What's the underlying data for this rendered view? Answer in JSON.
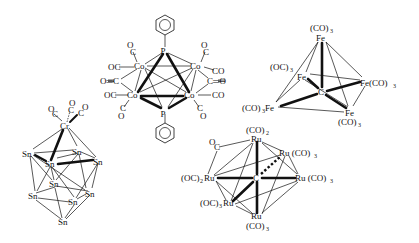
{
  "figure": {
    "background": "#ffffff",
    "ink": "#111111"
  },
  "clusters": {
    "co4p2": {
      "name": "Co4(CO)10(PPh)2",
      "atoms": {
        "p_top": "P",
        "p_bottom": "P",
        "co_tl": "Co",
        "co_tr": "Co",
        "co_bl": "Co",
        "co_br": "Co"
      },
      "ligands": {
        "tl_up": "O",
        "tl_up_c": "C",
        "tl_left": "OC",
        "bridge_left": "O═C",
        "bl_left": "OC",
        "bl_down_c": "C",
        "bl_down_o": "O",
        "tr_up": "O",
        "tr_up_c": "C",
        "tr_right": "CO",
        "bridge_right": "C═O",
        "br_right": "CO",
        "br_down_c": "C",
        "br_down_o": "O"
      }
    },
    "fe5c": {
      "name": "Fe5(CO)15C",
      "labels": {
        "top_co": "(CO)",
        "top_co_sub": "3",
        "top_fe": "Fe",
        "back_left_oc": "(OC)",
        "back_left_oc_sub": "3",
        "back_left_fe": "Fe",
        "right": "Fe(CO)",
        "right_sub": "3",
        "center": "C",
        "front_left": "(CO)",
        "front_left_sub": "3",
        "front_left_fe": "Fe",
        "bottom_fe": "Fe",
        "bottom_co": "(CO)",
        "bottom_co_sub": "3"
      }
    },
    "crsn9": {
      "name": "Sn9Cr(CO)3",
      "labels": {
        "cr": "Cr",
        "oc1_o": "O",
        "oc1_c": "C",
        "oc2_o": "O",
        "oc2_c": "C",
        "oc3_o": "O",
        "oc3_c": "C",
        "sn": "Sn"
      }
    },
    "ru6c": {
      "name": "Ru6(CO)17C",
      "labels": {
        "top_co": "(CO)",
        "top_co_sub": "2",
        "top_ru": "Ru",
        "bridge_o": "O",
        "bridge_c": "C",
        "rt": "Ru (CO)",
        "rt_sub": "3",
        "left": "(OC)",
        "left_sub": "2",
        "left_ru": "Ru",
        "center": "C",
        "right": "Ru (CO)",
        "right_sub": "3",
        "lb": "(OC)",
        "lb_sub": "3",
        "lb_ru": "Ru",
        "bottom_ru": "Ru",
        "bottom_co": "(CO)",
        "bottom_co_sub": "3"
      }
    }
  }
}
